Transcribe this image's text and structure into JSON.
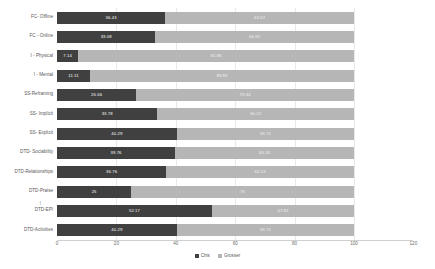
{
  "chart_data": {
    "type": "bar",
    "subtype": "stacked-horizontal-100-percent",
    "title": "",
    "xlabel": "",
    "ylabel": "",
    "xlim": [
      0,
      120
    ],
    "xticks": [
      "0",
      "20",
      "40",
      "60",
      "80",
      "100",
      "120"
    ],
    "xtick_values": [
      0,
      20,
      40,
      60,
      80,
      100,
      120
    ],
    "grid": true,
    "grid_axis": "x",
    "legend_position": "bottom-center",
    "categories": [
      "FC- Offline",
      "FC - Online",
      "I - Physical",
      "I - Mental",
      "SS-Reframing",
      "SS- Implicit",
      "SS- Explicit",
      "DTD- Sociability",
      "DTD-Relationships",
      "DTD-Praise",
      "DTD-EPI",
      "DTD-Activities"
    ],
    "series": [
      {
        "name": "Chis",
        "color": "#404040",
        "values": [
          36.43,
          33.08,
          7.14,
          11.11,
          26.66,
          33.78,
          40.29,
          39.76,
          36.76,
          25,
          52.17,
          40.29
        ]
      },
      {
        "name": "Grosser",
        "color": "#b6b6b6",
        "values": [
          63.57,
          66.92,
          92.86,
          88.89,
          73.34,
          66.22,
          59.71,
          60.24,
          63.24,
          75,
          47.83,
          59.71
        ]
      }
    ],
    "annotations": {
      "dtd_epi_marker": "|"
    }
  }
}
